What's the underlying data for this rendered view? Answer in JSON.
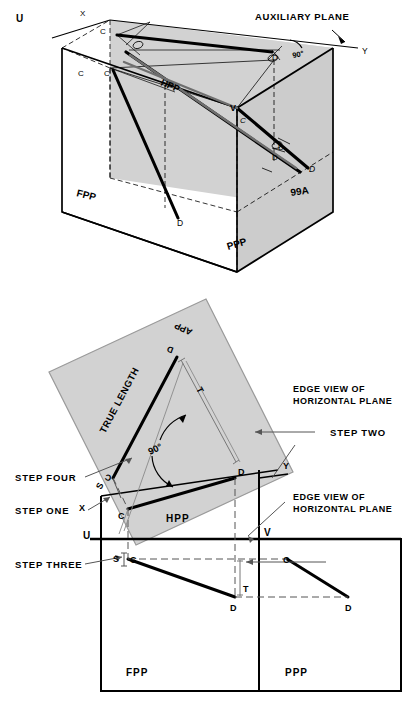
{
  "figure": {
    "number": "99A",
    "type": "engineering-drawing"
  },
  "pictorial": {
    "title_callout": "AUXILIARY PLANE",
    "plane_labels": {
      "hpp": "HPP",
      "fpp": "FPP",
      "ppp": "PPP"
    },
    "axis_labels": {
      "u": "U",
      "x": "X",
      "y": "Y",
      "v": "V"
    },
    "angle": "90°",
    "points": {
      "c1": "C",
      "c2": "C",
      "c3": "C",
      "c4": "C",
      "c5": "C",
      "d1": "D",
      "d2": "D",
      "d3": "D",
      "d4": "D",
      "d5": "D"
    }
  },
  "ortho": {
    "plane_labels": {
      "app": "APP",
      "hpp": "HPP",
      "fpp": "FPP",
      "ppp": "PPP"
    },
    "axis_labels": {
      "u": "U",
      "v": "V",
      "x": "X",
      "y": "Y"
    },
    "annotations": {
      "true_length": "TRUE LENGTH",
      "angle": "90°",
      "edge_view_1_line1": "EDGE VIEW OF",
      "edge_view_1_line2": "HORIZONTAL PLANE",
      "edge_view_2_line1": "EDGE VIEW OF",
      "edge_view_2_line2": "HORIZONTAL PLANE"
    },
    "steps": [
      {
        "id": "step-one",
        "label": "STEP ONE"
      },
      {
        "id": "step-two",
        "label": "STEP TWO"
      },
      {
        "id": "step-three",
        "label": "STEP THREE"
      },
      {
        "id": "step-four",
        "label": "STEP FOUR"
      }
    ],
    "dimensions": {
      "t1": "T",
      "t2": "T",
      "s1": "S",
      "s2": "S"
    },
    "points": {
      "app_c": "C",
      "app_d": "D",
      "hpp_c": "C",
      "hpp_d": "D",
      "fpp_c": "C",
      "fpp_d": "D",
      "ppp_c": "C",
      "ppp_d": "D"
    }
  },
  "colors": {
    "ink": "#000000",
    "shade": "#d2d2d2",
    "shade_edge": "#9a9a9a",
    "thin": "#3a3a3a",
    "leader": "#555555"
  }
}
